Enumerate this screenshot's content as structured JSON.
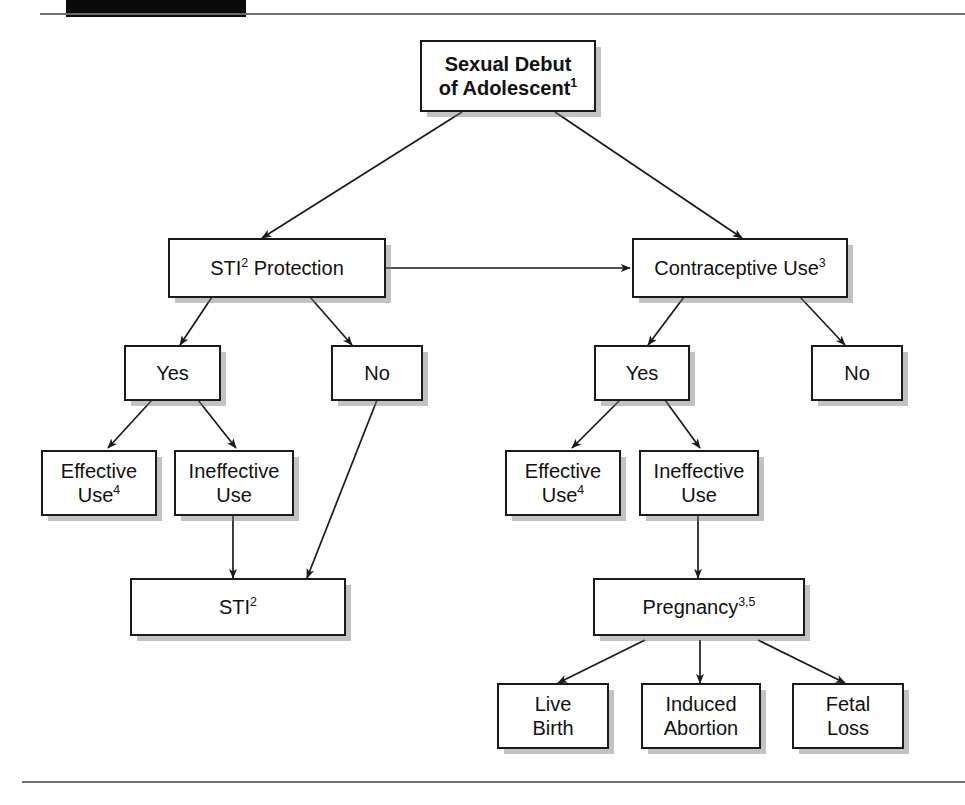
{
  "page": {
    "header_bar_label": "black-header-block",
    "top_rule_label": "top-horizontal-rule",
    "bottom_rule_label": "bottom-horizontal-rule"
  },
  "diagram": {
    "nodes": {
      "sexual_debut": {
        "line1": "Sexual Debut",
        "line2": "of Adolescent",
        "sup2": "1"
      },
      "sti_protection": {
        "text": "STI",
        "sup": "2",
        "text_after": " Protection"
      },
      "contraceptive_use": {
        "text": "Contraceptive Use",
        "sup": "3"
      },
      "sti_yes": {
        "text": "Yes"
      },
      "sti_no": {
        "text": "No"
      },
      "contra_yes": {
        "text": "Yes"
      },
      "contra_no": {
        "text": "No"
      },
      "sti_effective_use": {
        "line1": "Effective",
        "line2": "Use",
        "sup2": "4"
      },
      "sti_ineffective_use": {
        "line1": "Ineffective",
        "line2": "Use"
      },
      "sti_outcome": {
        "text": "STI",
        "sup": "2"
      },
      "contra_effective_use": {
        "line1": "Effective",
        "line2": "Use",
        "sup2": "4"
      },
      "contra_ineffective_use": {
        "line1": "Ineffective",
        "line2": "Use"
      },
      "pregnancy": {
        "text": "Pregnancy",
        "sup": "3,5"
      },
      "live_birth": {
        "line1": "Live",
        "line2": "Birth"
      },
      "induced_abortion": {
        "line1": "Induced",
        "line2": "Abortion"
      },
      "fetal_loss": {
        "line1": "Fetal",
        "line2": "Loss"
      }
    },
    "edges": [
      {
        "from": "sexual_debut",
        "to": "sti_protection"
      },
      {
        "from": "sexual_debut",
        "to": "contraceptive_use"
      },
      {
        "from": "sti_protection",
        "to": "contraceptive_use"
      },
      {
        "from": "sti_protection",
        "to": "sti_yes"
      },
      {
        "from": "sti_protection",
        "to": "sti_no"
      },
      {
        "from": "contraceptive_use",
        "to": "contra_yes"
      },
      {
        "from": "contraceptive_use",
        "to": "contra_no"
      },
      {
        "from": "sti_yes",
        "to": "sti_effective_use"
      },
      {
        "from": "sti_yes",
        "to": "sti_ineffective_use"
      },
      {
        "from": "sti_ineffective_use",
        "to": "sti_outcome"
      },
      {
        "from": "sti_no",
        "to": "sti_outcome"
      },
      {
        "from": "contra_yes",
        "to": "contra_effective_use"
      },
      {
        "from": "contra_yes",
        "to": "contra_ineffective_use"
      },
      {
        "from": "contra_ineffective_use",
        "to": "pregnancy"
      },
      {
        "from": "pregnancy",
        "to": "live_birth"
      },
      {
        "from": "pregnancy",
        "to": "induced_abortion"
      },
      {
        "from": "pregnancy",
        "to": "fetal_loss"
      }
    ],
    "colors": {
      "box_border": "#1a1a1a",
      "box_fill": "#ffffff",
      "shadow": "#9a9a9a",
      "arrow": "#1a1a1a",
      "rule": "#6d6d6d",
      "header_block": "#0a0a0a"
    }
  }
}
